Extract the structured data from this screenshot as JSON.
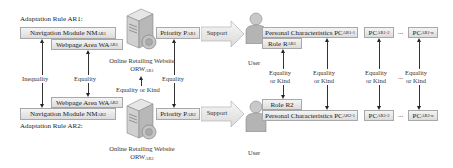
{
  "rule1": {
    "title": "Adaptation Rule AR1:",
    "nav_module": {
      "text": "Navigation Module NM",
      "sub": "AR1"
    },
    "webpage_area": {
      "text": "Webpage Area WA",
      "sub": "AR1"
    },
    "priority": {
      "text": "Priority P",
      "sub": "AR1"
    },
    "website": {
      "line1": "Online Retailing Website",
      "line2": "ORW",
      "sub": "AR1"
    },
    "support": "Support",
    "user_label": "User",
    "role": {
      "text": "Role R",
      "sub": "AR1"
    },
    "personal_characteristics": {
      "text": "Personal Characteristics PC",
      "sub": "AR1-1"
    },
    "pc2": {
      "text": "PC",
      "sub": "AR1-2"
    },
    "pcn": {
      "text": "PC",
      "sub": "AR1-n"
    },
    "ellipsis": "..."
  },
  "rule2": {
    "title": "Adaptation Rule AR2:",
    "nav_module": {
      "text": "Navigation Module NM",
      "sub": "AR2"
    },
    "webpage_area": {
      "text": "Webpage Area WA",
      "sub": "AR2"
    },
    "priority": {
      "text": "Priority P",
      "sub": "AR2"
    },
    "website": {
      "line1": "Online Retailing Website",
      "line2": "ORW",
      "sub": "AR2"
    },
    "support": "Support",
    "user_label": "User",
    "role": {
      "text": "Role R2"
    },
    "personal_characteristics": {
      "text": "Personal Characteristics PC",
      "sub": "AR2-1"
    },
    "pc2": {
      "text": "PC",
      "sub": "AR2-2"
    },
    "pcn": {
      "text": "PC",
      "sub": "AR2-n"
    },
    "ellipsis": "..."
  },
  "relations": {
    "nav": "Inequality",
    "webpage": "Equality",
    "website": "Equality or Kind",
    "priority": "Equality",
    "role": [
      "Equality",
      "or Kind"
    ],
    "pc1": [
      "Equality",
      "or Kind"
    ],
    "pc2": [
      "Equality",
      "or Kind"
    ],
    "pcn": [
      "Equality",
      "or Kind"
    ],
    "ellipsis": "..."
  },
  "colors": {
    "box_fill_top": "#f4f4f4",
    "box_fill_bottom": "#dcdcdc",
    "box_border": "#a8a8a8",
    "arrow": "#222222"
  }
}
